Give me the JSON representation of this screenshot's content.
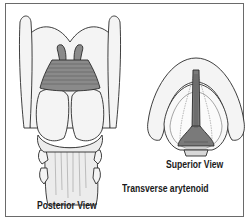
{
  "figure": {
    "views": [
      {
        "id": "posterior",
        "label": "Posterior View"
      },
      {
        "id": "superior",
        "label": "Superior View"
      }
    ],
    "muscle_label": "Transverse arytenoid",
    "colors": {
      "outline": "#2a2a2a",
      "cartilage_fill": "#f4f4f4",
      "muscle_fill": "#8a8a8a",
      "muscle_stripe": "#5a5a5a",
      "frame": "#6a6a6a"
    }
  }
}
